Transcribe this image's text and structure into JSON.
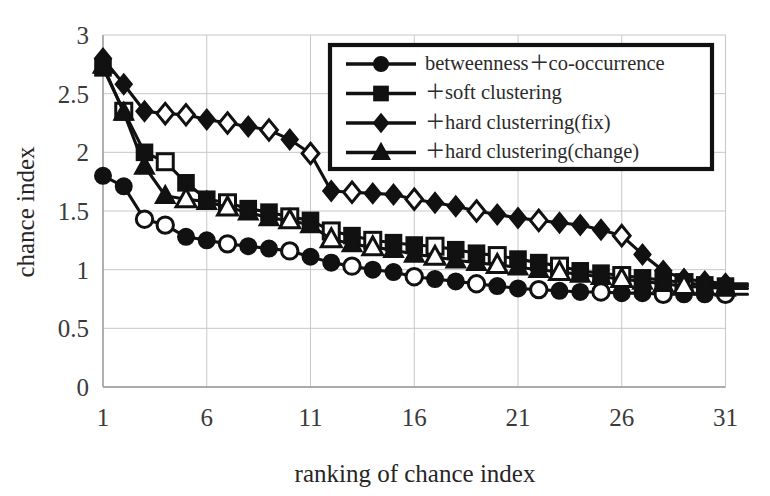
{
  "chart_data": {
    "type": "line",
    "title": "",
    "xlabel": "ranking of chance index",
    "ylabel": "chance index",
    "xlim": [
      1,
      31
    ],
    "ylim": [
      0,
      3
    ],
    "xticks": [
      1,
      6,
      11,
      16,
      21,
      26,
      31
    ],
    "yticks": [
      0,
      0.5,
      1,
      1.5,
      2,
      2.5,
      3
    ],
    "ytick_labels": [
      "0",
      "0.5",
      "1",
      "1.5",
      "2",
      "2.5",
      "3"
    ],
    "xtick_labels": [
      "1",
      "6",
      "11",
      "16",
      "21",
      "26",
      "31"
    ],
    "grid": true,
    "legend_position": "top-right",
    "x": [
      1,
      2,
      3,
      4,
      5,
      6,
      7,
      8,
      9,
      10,
      11,
      12,
      13,
      14,
      15,
      16,
      17,
      18,
      19,
      20,
      21,
      22,
      23,
      24,
      25,
      26,
      27,
      28,
      29,
      30,
      31
    ],
    "series": [
      {
        "name": "betweenness + co-occurrence",
        "marker": "circle",
        "values": [
          1.8,
          1.71,
          1.43,
          1.38,
          1.28,
          1.25,
          1.22,
          1.2,
          1.18,
          1.16,
          1.11,
          1.06,
          1.03,
          1.0,
          0.98,
          0.94,
          0.92,
          0.9,
          0.88,
          0.86,
          0.84,
          0.83,
          0.82,
          0.81,
          0.81,
          0.8,
          0.8,
          0.79,
          0.79,
          0.79,
          0.79
        ],
        "open_marker_indices": [
          2,
          3,
          6,
          9,
          12,
          15,
          18,
          21,
          24,
          27,
          30
        ]
      },
      {
        "name": "+ soft clustering",
        "marker": "square",
        "values": [
          2.72,
          2.35,
          2.0,
          1.92,
          1.74,
          1.6,
          1.57,
          1.52,
          1.49,
          1.45,
          1.42,
          1.33,
          1.29,
          1.25,
          1.23,
          1.21,
          1.2,
          1.17,
          1.14,
          1.12,
          1.09,
          1.06,
          1.03,
          0.99,
          0.97,
          0.95,
          0.93,
          0.91,
          0.89,
          0.87,
          0.86
        ],
        "open_marker_indices": [
          1,
          3,
          6,
          9,
          11,
          13,
          16,
          19,
          22,
          25,
          28
        ]
      },
      {
        "name": "+ hard clusterring(fix)",
        "marker": "diamond",
        "values": [
          2.8,
          2.58,
          2.35,
          2.33,
          2.32,
          2.28,
          2.25,
          2.22,
          2.19,
          2.11,
          1.99,
          1.67,
          1.66,
          1.65,
          1.64,
          1.6,
          1.57,
          1.54,
          1.5,
          1.47,
          1.44,
          1.42,
          1.4,
          1.38,
          1.34,
          1.29,
          1.13,
          0.99,
          0.92,
          0.9,
          0.88
        ],
        "open_marker_indices": [
          3,
          4,
          6,
          8,
          10,
          12,
          15,
          18,
          21,
          25
        ]
      },
      {
        "name": "+ hard clustering(change)",
        "marker": "triangle",
        "values": [
          2.74,
          2.34,
          1.88,
          1.63,
          1.6,
          1.58,
          1.53,
          1.49,
          1.44,
          1.42,
          1.38,
          1.26,
          1.22,
          1.19,
          1.17,
          1.13,
          1.11,
          1.08,
          1.06,
          1.04,
          1.02,
          1.0,
          0.98,
          0.96,
          0.94,
          0.92,
          0.9,
          0.88,
          0.86,
          0.85,
          0.84
        ],
        "open_marker_indices": [
          4,
          6,
          9,
          11,
          13,
          16,
          19,
          22,
          25,
          28
        ]
      }
    ]
  },
  "legend": {
    "entries": [
      {
        "label": "betweenness＋co-occurrence",
        "marker": "circle"
      },
      {
        "label": "＋soft clustering",
        "marker": "square"
      },
      {
        "label": "＋hard clusterring(fix)",
        "marker": "diamond"
      },
      {
        "label": "＋hard clustering(change)",
        "marker": "triangle"
      }
    ]
  },
  "axes": {
    "x_title": "ranking of chance index",
    "y_title": "chance index"
  },
  "colors": {
    "ink": "#111111",
    "grid": "#c8c8c8",
    "background": "#ffffff"
  }
}
